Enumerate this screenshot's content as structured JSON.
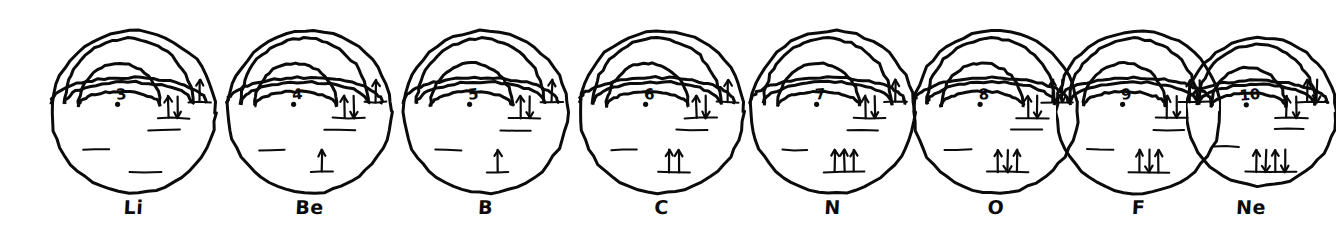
{
  "figure": {
    "style": "hand-drawn pen sketch, black ink on white paper",
    "ink_color": "#0b0b0b",
    "paper_color": "#ffffff"
  },
  "legend": {
    "spin_up_glyph": "↑",
    "spin_down_glyph": "↓",
    "orbital_dash_glyph": "—"
  },
  "atoms": [
    {
      "symbol": "Li",
      "atomic_number": "3",
      "nucleus_label": "3",
      "x": 36,
      "width": 195,
      "label_x": 36,
      "label_width": 195,
      "shells": {
        "1s": "↑↓",
        "2s": "↑",
        "2p": ""
      },
      "arrows": [
        {
          "orbital": "1s",
          "spins": [
            "up",
            "down"
          ],
          "cx": 137,
          "cy": 96
        },
        {
          "orbital": "2s",
          "spins": [
            "up"
          ],
          "cx": 164,
          "cy": 80
        },
        {
          "orbital": "2p",
          "spins": [],
          "cx": 110,
          "cy": 150
        }
      ]
    },
    {
      "symbol": "Be",
      "atomic_number": "4",
      "nucleus_label": "4",
      "x": 212,
      "width": 195,
      "label_x": 212,
      "label_width": 195,
      "shells": {
        "1s": "↑↓",
        "2s": "↑↓",
        "2p": "↑"
      },
      "arrows": [
        {
          "orbital": "1s",
          "spins": [
            "up",
            "down"
          ],
          "cx": 137,
          "cy": 96
        },
        {
          "orbital": "2s",
          "spins": [
            "up"
          ],
          "cx": 164,
          "cy": 80
        },
        {
          "orbital": "2p",
          "spins": [
            "up"
          ],
          "cx": 110,
          "cy": 150
        }
      ]
    },
    {
      "symbol": "B",
      "atomic_number": "5",
      "nucleus_label": "5",
      "x": 388,
      "width": 195,
      "label_x": 388,
      "label_width": 195,
      "shells": {
        "1s": "↑↓",
        "2s": "↑↓",
        "2p": "↑"
      },
      "arrows": [
        {
          "orbital": "1s",
          "spins": [
            "up",
            "down"
          ],
          "cx": 137,
          "cy": 96
        },
        {
          "orbital": "2s",
          "spins": [
            "up"
          ],
          "cx": 164,
          "cy": 80
        },
        {
          "orbital": "2p",
          "spins": [
            "up"
          ],
          "cx": 110,
          "cy": 150
        }
      ]
    },
    {
      "symbol": "C",
      "atomic_number": "6",
      "nucleus_label": "6",
      "x": 564,
      "width": 195,
      "label_x": 564,
      "label_width": 195,
      "shells": {
        "1s": "↑↓",
        "2s": "↑↓",
        "2p": "↑ ↑"
      },
      "arrows": [
        {
          "orbital": "1s",
          "spins": [
            "up",
            "down"
          ],
          "cx": 137,
          "cy": 96
        },
        {
          "orbital": "2s",
          "spins": [
            "up"
          ],
          "cx": 164,
          "cy": 80
        },
        {
          "orbital": "2p",
          "spins": [
            "up",
            "up"
          ],
          "cx": 110,
          "cy": 150
        }
      ]
    },
    {
      "symbol": "N",
      "atomic_number": "7",
      "nucleus_label": "7",
      "x": 740,
      "width": 185,
      "label_x": 740,
      "label_width": 185,
      "shells": {
        "1s": "↑↓",
        "2s": "↑↓",
        "2p": "↑ ↑ ↑"
      },
      "arrows": [
        {
          "orbital": "1s",
          "spins": [
            "up",
            "down"
          ],
          "cx": 137,
          "cy": 96
        },
        {
          "orbital": "2s",
          "spins": [
            "up"
          ],
          "cx": 164,
          "cy": 80
        },
        {
          "orbital": "2p",
          "spins": [
            "up",
            "up",
            "up"
          ],
          "cx": 110,
          "cy": 150
        }
      ]
    },
    {
      "symbol": "O",
      "atomic_number": "8",
      "nucleus_label": "8",
      "x": 906,
      "width": 180,
      "label_x": 906,
      "label_width": 180,
      "shells": {
        "1s": "↑↓",
        "2s": "↑↓",
        "2p": "↑↓ ↑ ↑"
      },
      "arrows": [
        {
          "orbital": "1s",
          "spins": [
            "up",
            "down"
          ],
          "cx": 137,
          "cy": 96
        },
        {
          "orbital": "2s",
          "spins": [
            "up",
            "down"
          ],
          "cx": 164,
          "cy": 80
        },
        {
          "orbital": "2p",
          "spins": [
            "up",
            "down",
            "up"
          ],
          "cx": 110,
          "cy": 150
        }
      ]
    },
    {
      "symbol": "F",
      "atomic_number": "9",
      "nucleus_label": "9",
      "x": 1056,
      "width": 165,
      "label_x": 1056,
      "label_width": 165,
      "shells": {
        "1s": "↑↓",
        "2s": "↑↓",
        "2p": "↑↓ ↑↓ ↑"
      },
      "arrows": [
        {
          "orbital": "1s",
          "spins": [
            "up",
            "down"
          ],
          "cx": 137,
          "cy": 96
        },
        {
          "orbital": "2s",
          "spins": [
            "up",
            "down"
          ],
          "cx": 164,
          "cy": 80
        },
        {
          "orbital": "2p",
          "spins": [
            "up",
            "down",
            "up"
          ],
          "cx": 110,
          "cy": 150
        }
      ]
    },
    {
      "symbol": "Ne",
      "atomic_number": "10",
      "nucleus_label": "10",
      "x": 1186,
      "width": 150,
      "label_x": 1176,
      "label_width": 150,
      "shells": {
        "1s": "↑↓",
        "2s": "↑↓",
        "2p": "↑↓ ↑↓ ↑↓"
      },
      "arrows": [
        {
          "orbital": "1s",
          "spins": [
            "up",
            "down"
          ],
          "cx": 137,
          "cy": 96
        },
        {
          "orbital": "2s",
          "spins": [
            "up",
            "down"
          ],
          "cx": 164,
          "cy": 80
        },
        {
          "orbital": "2p",
          "spins": [
            "up",
            "down",
            "up",
            "down"
          ],
          "cx": 110,
          "cy": 150
        }
      ]
    }
  ]
}
